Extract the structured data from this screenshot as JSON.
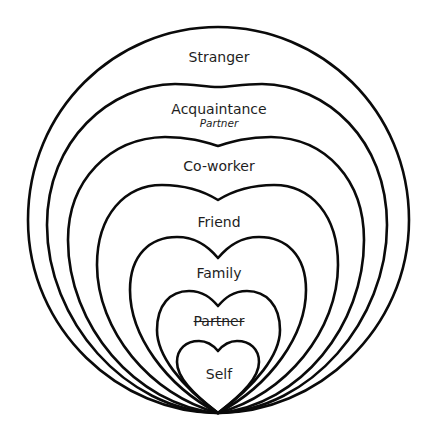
{
  "diagram": {
    "type": "nested-circles-of-relationship",
    "levels": [
      {
        "id": "stranger",
        "label": "Stranger",
        "shape": "circle"
      },
      {
        "id": "acquaintance",
        "label": "Acquaintance",
        "sublabel": "Partner",
        "sublabel_style": "italic",
        "shape": "rounded-heart"
      },
      {
        "id": "coworker",
        "label": "Co-worker",
        "shape": "rounded-heart"
      },
      {
        "id": "friend",
        "label": "Friend",
        "shape": "heart"
      },
      {
        "id": "family",
        "label": "Family",
        "shape": "heart"
      },
      {
        "id": "partner",
        "label": "Partner",
        "label_style": "strikethrough",
        "shape": "heart"
      },
      {
        "id": "self",
        "label": "Self",
        "shape": "heart"
      }
    ],
    "colors": {
      "stroke": "#0a0a0a",
      "text": "#1e1e1e",
      "background": "#ffffff"
    }
  }
}
